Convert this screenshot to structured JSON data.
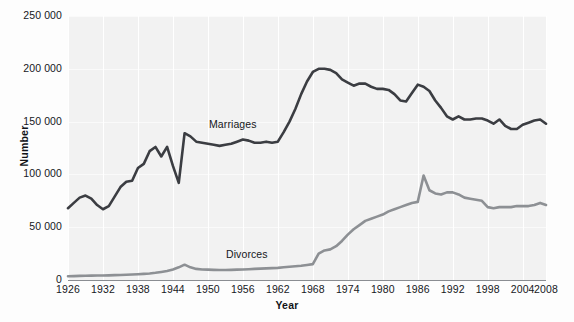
{
  "chart_data": {
    "type": "line",
    "title": "",
    "xlabel": "Year",
    "ylabel": "Number",
    "xlim": [
      1926,
      2008
    ],
    "ylim": [
      0,
      250000
    ],
    "grid": true,
    "legend_position": "inline-annotations",
    "x_ticks": [
      "1926",
      "1932",
      "1938",
      "1944",
      "1950",
      "1956",
      "1962",
      "1968",
      "1974",
      "1980",
      "1986",
      "1992",
      "1998",
      "2004",
      "2008"
    ],
    "y_ticks": [
      "0",
      "50 000",
      "100 000",
      "150 000",
      "200 000",
      "250 000"
    ],
    "y_tick_values": [
      0,
      50000,
      100000,
      150000,
      200000,
      250000
    ],
    "annotations": [
      {
        "text": "Marriages",
        "x": 1948,
        "y": 152000
      },
      {
        "text": "Divorces",
        "x": 1951,
        "y": 23000
      }
    ],
    "colors": {
      "marriages": "#3b3d42",
      "divorces": "#8d9094",
      "plot_background": "#f2f2f2",
      "gridline": "#ffffff",
      "axis": "#8a8d92",
      "text": "#16181c"
    },
    "x": [
      1926,
      1927,
      1928,
      1929,
      1930,
      1931,
      1932,
      1933,
      1934,
      1935,
      1936,
      1937,
      1938,
      1939,
      1940,
      1941,
      1942,
      1943,
      1944,
      1945,
      1946,
      1947,
      1948,
      1949,
      1950,
      1951,
      1952,
      1953,
      1954,
      1955,
      1956,
      1957,
      1958,
      1959,
      1960,
      1961,
      1962,
      1963,
      1964,
      1965,
      1966,
      1967,
      1968,
      1969,
      1970,
      1971,
      1972,
      1973,
      1974,
      1975,
      1976,
      1977,
      1978,
      1979,
      1980,
      1981,
      1982,
      1983,
      1984,
      1985,
      1986,
      1987,
      1988,
      1989,
      1990,
      1991,
      1992,
      1993,
      1994,
      1995,
      1996,
      1997,
      1998,
      1999,
      2000,
      2001,
      2002,
      2003,
      2004,
      2005,
      2006,
      2007,
      2008
    ],
    "series": [
      {
        "name": "Marriages",
        "color": "#3b3d42",
        "values": [
          68000,
          73000,
          78000,
          80000,
          77000,
          71000,
          67000,
          70000,
          79000,
          88000,
          93000,
          94000,
          106000,
          110000,
          122000,
          126000,
          117000,
          126000,
          108000,
          92000,
          139000,
          136000,
          131000,
          130000,
          129000,
          128000,
          127000,
          128000,
          129000,
          131000,
          133000,
          132000,
          130000,
          130000,
          131000,
          130000,
          131000,
          140000,
          150000,
          162000,
          176000,
          188000,
          197000,
          200000,
          200000,
          199000,
          196000,
          190000,
          187000,
          184000,
          186000,
          186000,
          183000,
          181000,
          181000,
          180000,
          176000,
          170000,
          169000,
          177000,
          185000,
          183000,
          179000,
          170000,
          163000,
          155000,
          152000,
          155000,
          152000,
          152000,
          153000,
          153000,
          151000,
          148000,
          152000,
          146000,
          143000,
          143000,
          147000,
          149000,
          151000,
          152000,
          148000
        ]
      },
      {
        "name": "Divorces",
        "color": "#8d9094",
        "values": [
          3500,
          3700,
          3900,
          4000,
          4100,
          4200,
          4300,
          4400,
          4600,
          4800,
          5000,
          5200,
          5500,
          5800,
          6200,
          6800,
          7600,
          8500,
          10000,
          12000,
          14500,
          12000,
          10500,
          10000,
          9800,
          9600,
          9500,
          9500,
          9600,
          9800,
          10000,
          10200,
          10500,
          10800,
          11000,
          11200,
          11500,
          12000,
          12500,
          13000,
          13500,
          14200,
          15000,
          25000,
          28000,
          29000,
          32000,
          37000,
          43000,
          48000,
          52000,
          56000,
          58000,
          60000,
          62000,
          65000,
          67000,
          69000,
          71000,
          73000,
          74000,
          99000,
          85000,
          82000,
          81000,
          83000,
          83000,
          81000,
          78000,
          77000,
          76000,
          75000,
          69000,
          68000,
          69000,
          69000,
          69000,
          70000,
          70000,
          70000,
          71000,
          73000,
          71000
        ]
      }
    ]
  }
}
